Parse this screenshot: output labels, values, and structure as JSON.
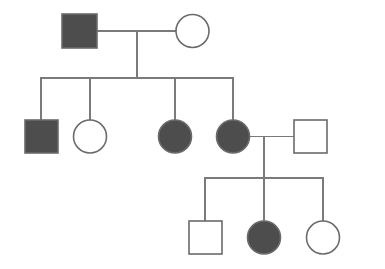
{
  "figure": {
    "width": 385,
    "height": 269,
    "background_color": "#ffffff"
  },
  "legend_colors": {
    "affected_fill": "#4d4d4d",
    "unaffected_fill": "#ffffff",
    "symbol_stroke": "#6b6b6b",
    "line_stroke": "#7a7a7a"
  },
  "style": {
    "symbol_stroke_width": 1.6,
    "line_stroke_width": 1.3,
    "square_size": 34,
    "circle_diameter": 33
  },
  "chart_data": {
    "type": "diagram",
    "diagram_kind": "pedigree",
    "generations": 3,
    "individuals": [
      {
        "id": "I-1",
        "generation": 1,
        "sex": "male",
        "shape": "square",
        "affected": true,
        "fill": "#4d4d4d",
        "x": 62,
        "y": 14,
        "w": 35,
        "h": 34,
        "cx": 79.5,
        "cy": 31
      },
      {
        "id": "I-2",
        "generation": 1,
        "sex": "female",
        "shape": "circle",
        "affected": false,
        "fill": "#ffffff",
        "cx": 192.5,
        "cy": 31,
        "r": 16.5
      },
      {
        "id": "II-1",
        "generation": 2,
        "sex": "male",
        "shape": "square",
        "affected": true,
        "fill": "#4d4d4d",
        "x": 25,
        "y": 120,
        "w": 33,
        "h": 33,
        "cx": 41.5,
        "cy": 136.5
      },
      {
        "id": "II-2",
        "generation": 2,
        "sex": "female",
        "shape": "circle",
        "affected": false,
        "fill": "#ffffff",
        "cx": 90,
        "cy": 136.5,
        "r": 16.5
      },
      {
        "id": "II-3",
        "generation": 2,
        "sex": "female",
        "shape": "circle",
        "affected": true,
        "fill": "#4d4d4d",
        "cx": 175,
        "cy": 136.5,
        "r": 16.5
      },
      {
        "id": "II-4",
        "generation": 2,
        "sex": "female",
        "shape": "circle",
        "affected": true,
        "fill": "#4d4d4d",
        "cx": 233,
        "cy": 136.5,
        "r": 16.5
      },
      {
        "id": "II-5",
        "generation": 2,
        "sex": "male",
        "shape": "square",
        "affected": false,
        "fill": "#ffffff",
        "x": 294,
        "y": 120,
        "w": 33,
        "h": 33,
        "cx": 310.5,
        "cy": 136.5
      },
      {
        "id": "III-1",
        "generation": 3,
        "sex": "male",
        "shape": "square",
        "affected": false,
        "fill": "#ffffff",
        "x": 189,
        "y": 221,
        "w": 33,
        "h": 33,
        "cx": 205.5,
        "cy": 237.5
      },
      {
        "id": "III-2",
        "generation": 3,
        "sex": "female",
        "shape": "circle",
        "affected": true,
        "fill": "#4d4d4d",
        "cx": 264,
        "cy": 237.5,
        "r": 16.5
      },
      {
        "id": "III-3",
        "generation": 3,
        "sex": "female",
        "shape": "circle",
        "affected": false,
        "fill": "#ffffff",
        "cx": 323,
        "cy": 237.5,
        "r": 16.5
      }
    ],
    "matings": [
      {
        "id": "mating-1",
        "partners": [
          "I-1",
          "I-2"
        ],
        "mating_line_y": 31,
        "mating_line_x1": 97,
        "mating_line_x2": 176,
        "descent_x": 137,
        "descent_y1": 31,
        "descent_y2": 78,
        "children": [
          "II-1",
          "II-2",
          "II-3",
          "II-4"
        ]
      },
      {
        "id": "mating-2",
        "partners": [
          "II-4",
          "II-5"
        ],
        "mating_line_y": 136.5,
        "mating_line_x1": 249,
        "mating_line_x2": 294,
        "descent_x": 264,
        "descent_y1": 136.5,
        "descent_y2": 178,
        "children": [
          "III-1",
          "III-2",
          "III-3"
        ]
      }
    ],
    "sibships": [
      {
        "id": "sibship-1",
        "bar_y": 78,
        "bar_x1": 41,
        "bar_x2": 233,
        "drop_y2": 120,
        "drops": [
          41,
          90,
          175,
          233
        ]
      },
      {
        "id": "sibship-2",
        "bar_y": 178,
        "bar_x1": 205,
        "bar_x2": 323,
        "drop_y2": 221,
        "drops": [
          205,
          264,
          323
        ]
      }
    ],
    "counts": {
      "total_individuals": 10,
      "affected": 5,
      "unaffected": 5,
      "males": 4,
      "females": 6
    }
  }
}
